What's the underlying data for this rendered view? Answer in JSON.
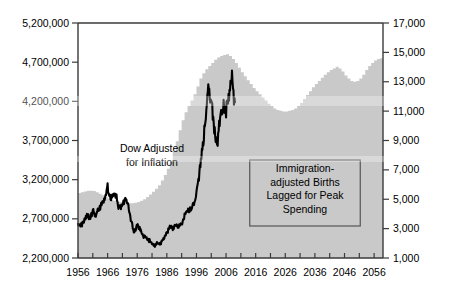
{
  "chart_data": {
    "type": "area",
    "title": "",
    "subtitle": "",
    "xlabel": "",
    "ylabel": "",
    "grid": false,
    "legend_position": "none",
    "x_axis": {
      "name": "Year",
      "min": 1956,
      "max": 2059,
      "tick_step": 5,
      "label_step": 10,
      "tick_labels": [
        "1956",
        "1966",
        "1976",
        "1986",
        "1996",
        "2006",
        "2016",
        "2026",
        "2036",
        "2046",
        "2056"
      ],
      "tick_values": [
        1956,
        1966,
        1976,
        1986,
        1996,
        2006,
        2016,
        2026,
        2036,
        2046,
        2056
      ]
    },
    "y_axis_left": {
      "name": "Immigration-adjusted Births",
      "min": 2200000,
      "max": 5200000,
      "tick_step": 500000,
      "tick_labels": [
        "2,200,000",
        "2,700,000",
        "3,200,000",
        "3,700,000",
        "4,200,000",
        "4,700,000",
        "5,200,000"
      ],
      "tick_values": [
        2200000,
        2700000,
        3200000,
        3700000,
        4200000,
        4700000,
        5200000
      ]
    },
    "y_axis_right": {
      "name": "Dow Adjusted for Inflation",
      "min": 1000,
      "max": 17000,
      "tick_step": 2000,
      "tick_labels": [
        "1,000",
        "3,000",
        "5,000",
        "7,000",
        "9,000",
        "11,000",
        "13,000",
        "15,000",
        "17,000"
      ],
      "tick_values": [
        1000,
        3000,
        5000,
        7000,
        9000,
        11000,
        13000,
        15000,
        17000
      ]
    },
    "series": [
      {
        "name": "Immigration-adjusted Births Lagged for Peak Spending",
        "type": "area",
        "axis": "left",
        "color": "#c9c9c9",
        "x": [
          1956,
          1957,
          1958,
          1959,
          1960,
          1961,
          1962,
          1963,
          1964,
          1965,
          1966,
          1967,
          1968,
          1969,
          1970,
          1971,
          1972,
          1973,
          1974,
          1975,
          1976,
          1977,
          1978,
          1979,
          1980,
          1981,
          1982,
          1983,
          1984,
          1985,
          1986,
          1987,
          1988,
          1989,
          1990,
          1991,
          1992,
          1993,
          1994,
          1995,
          1996,
          1997,
          1998,
          1999,
          2000,
          2001,
          2002,
          2003,
          2004,
          2005,
          2006,
          2007,
          2008,
          2009,
          2010,
          2011,
          2012,
          2013,
          2014,
          2015,
          2016,
          2017,
          2018,
          2019,
          2020,
          2021,
          2022,
          2023,
          2024,
          2025,
          2026,
          2027,
          2028,
          2029,
          2030,
          2031,
          2032,
          2033,
          2034,
          2035,
          2036,
          2037,
          2038,
          2039,
          2040,
          2041,
          2042,
          2043,
          2044,
          2045,
          2046,
          2047,
          2048,
          2049,
          2050,
          2051,
          2052,
          2053,
          2054,
          2055,
          2056,
          2057,
          2058,
          2059
        ],
        "values": [
          3030000,
          3040000,
          3050000,
          3060000,
          3060000,
          3055000,
          3040000,
          3020000,
          3000000,
          2980000,
          2960000,
          2945000,
          2930000,
          2920000,
          2915000,
          2910000,
          2905000,
          2900000,
          2900000,
          2905000,
          2915000,
          2930000,
          2950000,
          2980000,
          3010000,
          3045000,
          3085000,
          3130000,
          3190000,
          3260000,
          3340000,
          3440000,
          3560000,
          3690000,
          3830000,
          3960000,
          4060000,
          4140000,
          4210000,
          4290000,
          4390000,
          4490000,
          4560000,
          4610000,
          4650000,
          4690000,
          4730000,
          4760000,
          4780000,
          4790000,
          4800000,
          4780000,
          4740000,
          4690000,
          4630000,
          4570000,
          4520000,
          4470000,
          4420000,
          4370000,
          4330000,
          4290000,
          4250000,
          4210000,
          4170000,
          4140000,
          4110000,
          4090000,
          4080000,
          4070000,
          4070000,
          4080000,
          4090000,
          4110000,
          4140000,
          4180000,
          4230000,
          4280000,
          4330000,
          4380000,
          4420000,
          4460000,
          4500000,
          4540000,
          4570000,
          4600000,
          4620000,
          4640000,
          4620000,
          4580000,
          4530000,
          4490000,
          4460000,
          4450000,
          4460000,
          4490000,
          4540000,
          4600000,
          4650000,
          4690000,
          4720000,
          4740000,
          4750000,
          4760000
        ]
      },
      {
        "name": "Dow Adjusted for Inflation",
        "type": "line",
        "axis": "right",
        "color": "#000000",
        "x": [
          1956,
          1957,
          1958,
          1959,
          1960,
          1961,
          1962,
          1963,
          1964,
          1965,
          1966,
          1967,
          1968,
          1969,
          1970,
          1971,
          1972,
          1973,
          1974,
          1975,
          1976,
          1977,
          1978,
          1979,
          1980,
          1981,
          1982,
          1983,
          1984,
          1985,
          1986,
          1987,
          1988,
          1989,
          1990,
          1991,
          1992,
          1993,
          1994,
          1995,
          1996,
          1997,
          1998,
          1999,
          2000,
          2001,
          2002,
          2003,
          2004,
          2005,
          2006,
          2007,
          2008,
          2009
        ],
        "values": [
          3400,
          3200,
          3600,
          3900,
          3700,
          4200,
          3800,
          4300,
          4700,
          5000,
          5800,
          4900,
          5300,
          5100,
          4400,
          4700,
          5000,
          4600,
          3400,
          2800,
          3200,
          2900,
          2500,
          2400,
          2200,
          2000,
          1800,
          2100,
          2000,
          2300,
          2700,
          3100,
          3000,
          3300,
          3200,
          3300,
          3800,
          4100,
          4300,
          4600,
          5400,
          6800,
          8500,
          10500,
          12900,
          11600,
          9800,
          8600,
          10800,
          11200,
          11000,
          12100,
          13400,
          11600
        ]
      }
    ],
    "annotations": [
      {
        "id": "dow-annotation",
        "lines": [
          "Dow Adjusted",
          "for Inflation"
        ],
        "boxed": false,
        "x_center_px": 152,
        "y_top_px": 152
      },
      {
        "id": "births-annotation",
        "lines": [
          "Immigration-",
          "adjusted Births",
          "Lagged for Peak",
          "Spending"
        ],
        "boxed": true,
        "x_center_px": 305,
        "y_top_px": 172
      }
    ]
  }
}
